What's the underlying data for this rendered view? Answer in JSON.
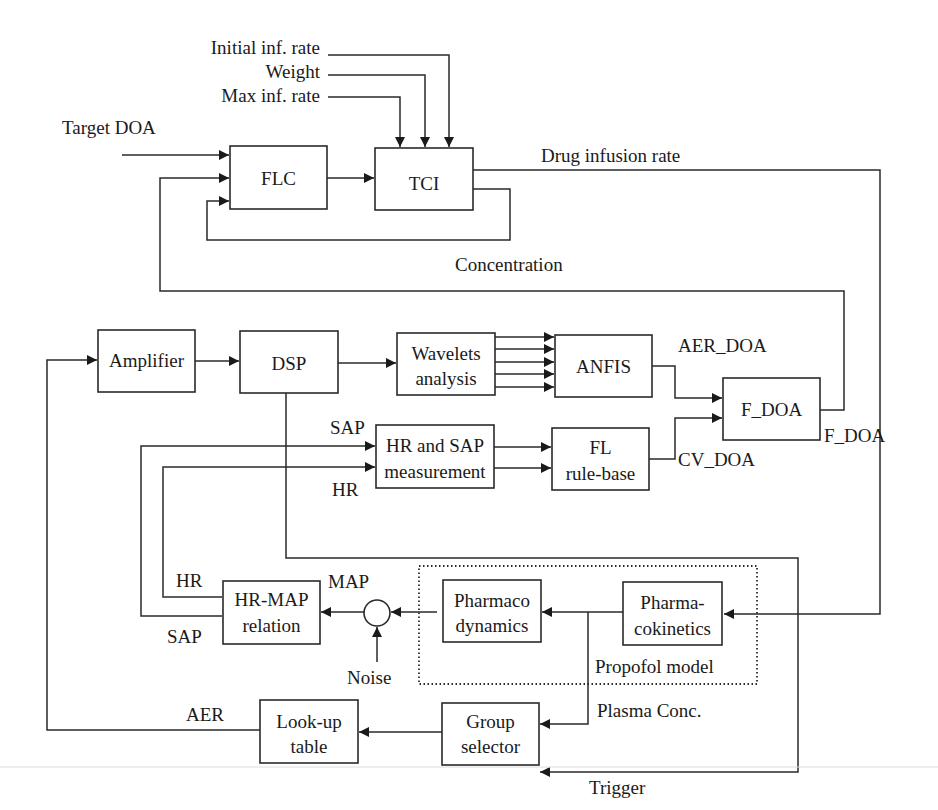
{
  "diagram": {
    "inputs": {
      "initial_inf_rate": "Initial inf. rate",
      "weight": "Weight",
      "max_inf_rate": "Max inf. rate",
      "target_doa": "Target DOA"
    },
    "blocks": {
      "flc": "FLC",
      "tci": "TCI",
      "amplifier": "Amplifier",
      "dsp": "DSP",
      "wavelets_line1": "Wavelets",
      "wavelets_line2": "analysis",
      "anfis": "ANFIS",
      "f_doa": "F_DOA",
      "hr_sap_line1": "HR and SAP",
      "hr_sap_line2": "measurement",
      "fl_line1": "FL",
      "fl_line2": "rule-base",
      "hr_map_line1": "HR-MAP",
      "hr_map_line2": "relation",
      "pd_line1": "Pharmaco",
      "pd_line2": "dynamics",
      "pk_line1": "Pharma-",
      "pk_line2": "cokinetics",
      "lookup_line1": "Look-up",
      "lookup_line2": "table",
      "group_line1": "Group",
      "group_line2": "selector"
    },
    "signals": {
      "drug_infusion_rate": "Drug infusion rate",
      "concentration": "Concentration",
      "aer_doa": "AER_DOA",
      "f_doa_out": "F_DOA",
      "cv_doa": "CV_DOA",
      "sap_top": "SAP",
      "hr_top": "HR",
      "hr_left": "HR",
      "sap_left": "SAP",
      "map": "MAP",
      "noise": "Noise",
      "propofol_model": "Propofol model",
      "plasma_conc": "Plasma Conc.",
      "aer": "AER",
      "trigger": "Trigger"
    }
  }
}
